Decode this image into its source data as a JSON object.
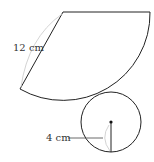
{
  "diagram": {
    "type": "cone-net",
    "sector": {
      "slant_label": "12 cm"
    },
    "base_circle": {
      "radius_label": "4 cm"
    },
    "colors": {
      "stroke": "#222222",
      "helper": "#c8c8c8",
      "text": "#333333"
    }
  }
}
